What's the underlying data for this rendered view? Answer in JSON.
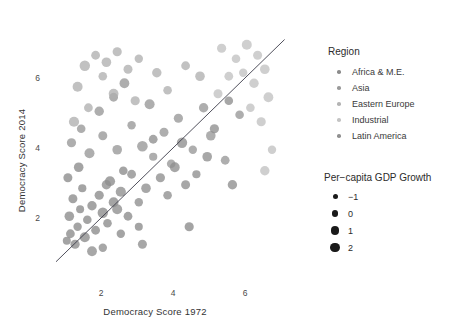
{
  "chart_data": {
    "type": "scatter",
    "title": "",
    "xlabel": "Democracy Score 1972",
    "ylabel": "Democracy Score 2014",
    "xticks": [
      2,
      4,
      6
    ],
    "yticks": [
      2,
      4,
      6
    ],
    "xlim": [
      0.6,
      7.2
    ],
    "ylim": [
      0.7,
      7.4
    ],
    "grid": false,
    "reference_line": {
      "type": "diagonal",
      "note": "y = x",
      "x": [
        0.75,
        7.1
      ],
      "y": [
        0.75,
        7.1
      ]
    },
    "legends": [
      {
        "title": "Region",
        "encoding": "color",
        "position": "right-top",
        "entries": [
          {
            "label": "Africa & M.E.",
            "color": "#8c8c8c"
          },
          {
            "label": "Asia",
            "color": "#9a9a9a"
          },
          {
            "label": "Eastern Europe",
            "color": "#b4b4b4"
          },
          {
            "label": "Industrial",
            "color": "#c4c4c4"
          },
          {
            "label": "Latin America",
            "color": "#909090"
          }
        ]
      },
      {
        "title": "Per−capita GDP Growth",
        "encoding": "size",
        "position": "right-bottom",
        "entries": [
          {
            "label": "−1",
            "size": 5
          },
          {
            "label": "0",
            "size": 6.6
          },
          {
            "label": "1",
            "size": 8.2
          },
          {
            "label": "2",
            "size": 9.6
          }
        ]
      }
    ],
    "series": [
      {
        "name": "Africa & M.E.",
        "color": "#8a8a8a",
        "points": [
          {
            "x": 1.05,
            "y": 1.35,
            "r": 4.0
          },
          {
            "x": 1.15,
            "y": 1.55,
            "r": 4.4
          },
          {
            "x": 1.28,
            "y": 1.25,
            "r": 4.6
          },
          {
            "x": 1.35,
            "y": 1.75,
            "r": 4.2
          },
          {
            "x": 1.12,
            "y": 2.05,
            "r": 4.8
          },
          {
            "x": 1.42,
            "y": 2.25,
            "r": 4.0
          },
          {
            "x": 1.22,
            "y": 2.55,
            "r": 4.5
          },
          {
            "x": 1.55,
            "y": 1.45,
            "r": 5.0
          },
          {
            "x": 1.62,
            "y": 1.95,
            "r": 4.3
          },
          {
            "x": 1.75,
            "y": 2.35,
            "r": 4.7
          },
          {
            "x": 1.48,
            "y": 2.85,
            "r": 4.1
          },
          {
            "x": 1.85,
            "y": 1.65,
            "r": 4.4
          },
          {
            "x": 2.05,
            "y": 2.15,
            "r": 5.2
          },
          {
            "x": 2.18,
            "y": 1.85,
            "r": 4.3
          },
          {
            "x": 1.95,
            "y": 2.65,
            "r": 4.6
          },
          {
            "x": 2.35,
            "y": 2.45,
            "r": 4.9
          },
          {
            "x": 2.55,
            "y": 1.55,
            "r": 4.2
          },
          {
            "x": 1.08,
            "y": 3.15,
            "r": 4.5
          },
          {
            "x": 1.38,
            "y": 3.45,
            "r": 4.8
          },
          {
            "x": 2.75,
            "y": 2.05,
            "r": 4.4
          },
          {
            "x": 3.05,
            "y": 1.75,
            "r": 4.0
          },
          {
            "x": 2.25,
            "y": 3.05,
            "r": 5.1
          },
          {
            "x": 2.62,
            "y": 3.35,
            "r": 4.3
          },
          {
            "x": 4.45,
            "y": 1.75,
            "r": 4.6
          }
        ]
      },
      {
        "name": "Asia",
        "color": "#979797",
        "points": [
          {
            "x": 1.18,
            "y": 4.15,
            "r": 4.6
          },
          {
            "x": 1.45,
            "y": 4.55,
            "r": 4.3
          },
          {
            "x": 1.68,
            "y": 3.85,
            "r": 5.0
          },
          {
            "x": 2.05,
            "y": 4.35,
            "r": 4.5
          },
          {
            "x": 2.45,
            "y": 3.95,
            "r": 4.8
          },
          {
            "x": 2.85,
            "y": 4.65,
            "r": 4.2
          },
          {
            "x": 1.95,
            "y": 5.05,
            "r": 4.7
          },
          {
            "x": 2.35,
            "y": 5.45,
            "r": 4.4
          },
          {
            "x": 3.15,
            "y": 4.05,
            "r": 5.3
          },
          {
            "x": 3.45,
            "y": 3.75,
            "r": 4.1
          },
          {
            "x": 2.65,
            "y": 5.85,
            "r": 4.9
          },
          {
            "x": 3.75,
            "y": 4.45,
            "r": 4.5
          },
          {
            "x": 3.95,
            "y": 3.55,
            "r": 4.3
          },
          {
            "x": 4.15,
            "y": 4.85,
            "r": 4.6
          },
          {
            "x": 3.35,
            "y": 5.25,
            "r": 5.0
          },
          {
            "x": 4.55,
            "y": 3.95,
            "r": 4.2
          },
          {
            "x": 5.05,
            "y": 4.35,
            "r": 4.8
          },
          {
            "x": 5.45,
            "y": 3.65,
            "r": 4.4
          },
          {
            "x": 4.85,
            "y": 5.15,
            "r": 4.7
          },
          {
            "x": 5.85,
            "y": 4.95,
            "r": 4.3
          }
        ]
      },
      {
        "name": "Eastern Europe",
        "color": "#b0b0b0",
        "points": [
          {
            "x": 1.55,
            "y": 6.35,
            "r": 5.2
          },
          {
            "x": 1.85,
            "y": 6.65,
            "r": 4.4
          },
          {
            "x": 2.15,
            "y": 6.45,
            "r": 4.8
          },
          {
            "x": 2.45,
            "y": 6.75,
            "r": 4.6
          },
          {
            "x": 2.05,
            "y": 6.05,
            "r": 4.3
          },
          {
            "x": 1.35,
            "y": 5.75,
            "r": 5.0
          },
          {
            "x": 2.75,
            "y": 6.25,
            "r": 4.5
          },
          {
            "x": 3.05,
            "y": 6.55,
            "r": 4.2
          },
          {
            "x": 2.35,
            "y": 5.55,
            "r": 4.9
          },
          {
            "x": 1.65,
            "y": 5.15,
            "r": 4.4
          },
          {
            "x": 3.55,
            "y": 6.15,
            "r": 4.7
          },
          {
            "x": 3.85,
            "y": 5.65,
            "r": 4.3
          },
          {
            "x": 1.25,
            "y": 4.75,
            "r": 5.1
          },
          {
            "x": 2.95,
            "y": 5.35,
            "r": 4.6
          },
          {
            "x": 4.35,
            "y": 6.35,
            "r": 4.4
          },
          {
            "x": 4.75,
            "y": 6.05,
            "r": 4.8
          }
        ]
      },
      {
        "name": "Industrial",
        "color": "#c2c2c2",
        "points": [
          {
            "x": 5.35,
            "y": 6.85,
            "r": 4.6
          },
          {
            "x": 5.75,
            "y": 6.55,
            "r": 4.3
          },
          {
            "x": 6.05,
            "y": 6.95,
            "r": 5.0
          },
          {
            "x": 6.35,
            "y": 6.65,
            "r": 4.5
          },
          {
            "x": 6.55,
            "y": 6.25,
            "r": 4.8
          },
          {
            "x": 5.95,
            "y": 6.15,
            "r": 4.2
          },
          {
            "x": 6.25,
            "y": 5.85,
            "r": 4.7
          },
          {
            "x": 5.55,
            "y": 6.05,
            "r": 4.4
          },
          {
            "x": 6.65,
            "y": 5.45,
            "r": 4.9
          },
          {
            "x": 6.15,
            "y": 5.15,
            "r": 4.3
          },
          {
            "x": 6.45,
            "y": 4.75,
            "r": 4.6
          },
          {
            "x": 5.25,
            "y": 5.55,
            "r": 4.5
          },
          {
            "x": 6.75,
            "y": 3.95,
            "r": 4.2
          },
          {
            "x": 6.55,
            "y": 3.35,
            "r": 4.7
          }
        ]
      },
      {
        "name": "Latin America",
        "color": "#8e8e8e",
        "points": [
          {
            "x": 2.15,
            "y": 2.95,
            "r": 4.7
          },
          {
            "x": 2.55,
            "y": 2.75,
            "r": 5.1
          },
          {
            "x": 2.85,
            "y": 3.25,
            "r": 4.4
          },
          {
            "x": 3.25,
            "y": 2.85,
            "r": 4.8
          },
          {
            "x": 3.05,
            "y": 2.45,
            "r": 4.2
          },
          {
            "x": 3.65,
            "y": 3.15,
            "r": 4.6
          },
          {
            "x": 2.45,
            "y": 2.25,
            "r": 5.0
          },
          {
            "x": 3.85,
            "y": 2.65,
            "r": 4.3
          },
          {
            "x": 4.05,
            "y": 3.45,
            "r": 4.9
          },
          {
            "x": 4.35,
            "y": 2.95,
            "r": 4.5
          },
          {
            "x": 4.65,
            "y": 3.25,
            "r": 4.1
          },
          {
            "x": 4.95,
            "y": 3.75,
            "r": 4.8
          },
          {
            "x": 3.45,
            "y": 4.25,
            "r": 4.4
          },
          {
            "x": 5.15,
            "y": 4.55,
            "r": 4.6
          },
          {
            "x": 4.25,
            "y": 4.15,
            "r": 5.2
          },
          {
            "x": 5.55,
            "y": 5.35,
            "r": 4.3
          },
          {
            "x": 5.65,
            "y": 2.95,
            "r": 4.7
          },
          {
            "x": 3.15,
            "y": 1.25,
            "r": 4.5
          },
          {
            "x": 2.05,
            "y": 1.15,
            "r": 4.2
          },
          {
            "x": 1.75,
            "y": 1.05,
            "r": 4.9
          }
        ]
      }
    ]
  }
}
